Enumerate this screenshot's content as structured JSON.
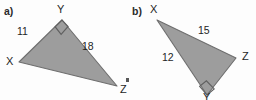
{
  "figure": {
    "background_color": "#fdfdfd",
    "fill_color": "#9d9d9d",
    "stroke_color": "#6e6e6e",
    "text_color": "#1f1f1f"
  },
  "parts": [
    {
      "id": "a",
      "part_label": "a)",
      "triangle": {
        "right_angle_at": "Y",
        "vertices": [
          {
            "name": "X",
            "label": "X",
            "x": 19,
            "y": 62,
            "label_x": 6,
            "label_y": 56
          },
          {
            "name": "Y",
            "label": "Y",
            "x": 62,
            "y": 20,
            "label_x": 57,
            "label_y": 4
          },
          {
            "name": "Z",
            "label": "Z",
            "x": 117,
            "y": 86,
            "label_x": 120,
            "label_y": 84
          }
        ],
        "sides": [
          {
            "name": "XY",
            "length_label": "11",
            "label_x": 17,
            "label_y": 26
          },
          {
            "name": "YZ",
            "length_label": "18",
            "label_x": 82,
            "label_y": 41
          },
          {
            "name": "XZ",
            "length_label": "",
            "label_x": 0,
            "label_y": 0
          }
        ]
      }
    },
    {
      "id": "b",
      "part_label": "b)",
      "triangle": {
        "right_angle_at": "Y",
        "vertices": [
          {
            "name": "X",
            "label": "X",
            "x": 157,
            "y": 20,
            "label_x": 150,
            "label_y": 4
          },
          {
            "name": "Z",
            "label": "Z",
            "x": 236,
            "y": 58,
            "label_x": 242,
            "label_y": 51
          },
          {
            "name": "Y",
            "label": "Y",
            "x": 207,
            "y": 95,
            "label_x": 203,
            "label_y": 92
          }
        ],
        "sides": [
          {
            "name": "XZ",
            "length_label": "15",
            "label_x": 198,
            "label_y": 25
          },
          {
            "name": "XY",
            "length_label": "12",
            "label_x": 162,
            "label_y": 52
          },
          {
            "name": "YZ",
            "length_label": "",
            "label_x": 0,
            "label_y": 0
          }
        ]
      }
    }
  ]
}
